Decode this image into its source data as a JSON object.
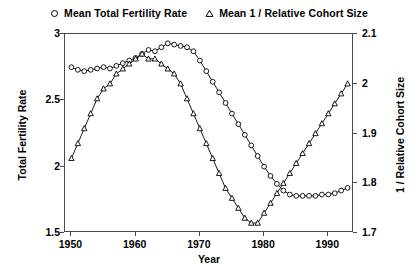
{
  "legend": {
    "entries": [
      {
        "marker": "circle-marker",
        "label": "Mean Total Fertility Rate"
      },
      {
        "marker": "triangle-marker",
        "label": "Mean 1 / Relative Cohort Size"
      }
    ]
  },
  "axes": {
    "y_left_title": "Total Fertility Rate",
    "y_right_title": "1 / Relative Cohort Size",
    "x_title": "Year",
    "y_left_ticks": [
      "1.5",
      "2",
      "2.5",
      "3"
    ],
    "y_right_ticks": [
      "1.7",
      "1.8",
      "1.9",
      "2",
      "2.1"
    ],
    "x_ticks": [
      "1950",
      "1960",
      "1970",
      "1980",
      "1990"
    ]
  },
  "chart_data": {
    "type": "line",
    "title": "",
    "xlabel": "Year",
    "ylabel": "Total Fertility Rate",
    "y2label": "1 / Relative Cohort Size",
    "xlim": [
      1949,
      1994
    ],
    "ylim": [
      1.5,
      3.0
    ],
    "y2lim": [
      1.7,
      2.1
    ],
    "grid": false,
    "legend_position": "top-center",
    "x": [
      1950,
      1951,
      1952,
      1953,
      1954,
      1955,
      1956,
      1957,
      1958,
      1959,
      1960,
      1961,
      1962,
      1963,
      1964,
      1965,
      1966,
      1967,
      1968,
      1969,
      1970,
      1971,
      1972,
      1973,
      1974,
      1975,
      1976,
      1977,
      1978,
      1979,
      1980,
      1981,
      1982,
      1983,
      1984,
      1985,
      1986,
      1987,
      1988,
      1989,
      1990,
      1991,
      1992,
      1993
    ],
    "series": [
      {
        "name": "Mean Total Fertility Rate",
        "marker": "circle",
        "axis": "left",
        "values": [
          2.75,
          2.73,
          2.72,
          2.73,
          2.74,
          2.75,
          2.74,
          2.76,
          2.78,
          2.8,
          2.82,
          2.85,
          2.88,
          2.87,
          2.9,
          2.93,
          2.92,
          2.91,
          2.9,
          2.87,
          2.8,
          2.72,
          2.64,
          2.56,
          2.48,
          2.4,
          2.32,
          2.24,
          2.16,
          2.08,
          2.0,
          1.93,
          1.87,
          1.82,
          1.79,
          1.78,
          1.78,
          1.78,
          1.78,
          1.79,
          1.79,
          1.8,
          1.82,
          1.84
        ]
      },
      {
        "name": "Mean 1 / Relative Cohort Size",
        "marker": "triangle",
        "axis": "right",
        "values": [
          1.85,
          1.88,
          1.91,
          1.94,
          1.97,
          1.99,
          2.0,
          2.02,
          2.03,
          2.04,
          2.05,
          2.06,
          2.05,
          2.05,
          2.04,
          2.03,
          2.02,
          2.0,
          1.97,
          1.94,
          1.91,
          1.88,
          1.85,
          1.82,
          1.79,
          1.77,
          1.75,
          1.73,
          1.72,
          1.72,
          1.74,
          1.76,
          1.78,
          1.8,
          1.82,
          1.84,
          1.86,
          1.88,
          1.9,
          1.92,
          1.94,
          1.96,
          1.98,
          2.0
        ]
      }
    ]
  }
}
